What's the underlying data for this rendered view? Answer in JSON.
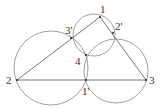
{
  "points": {
    "p1": {
      "label": "1",
      "x": 100,
      "y": 17
    },
    "p2": {
      "label": "2",
      "x": 17,
      "y": 80
    },
    "p3": {
      "label": "3",
      "x": 146,
      "y": 80
    },
    "p1p": {
      "label": "1'",
      "x": 86,
      "y": 80
    },
    "p2p": {
      "label": "2'",
      "x": 113,
      "y": 33
    },
    "p3p": {
      "label": "3'",
      "x": 71,
      "y": 38
    },
    "p4": {
      "label": "4",
      "x": 86,
      "y": 55
    }
  },
  "circles": [
    {
      "name": "small-circle",
      "cx": 94,
      "cy": 35,
      "r": 21
    },
    {
      "name": "left-circle",
      "cx": 51,
      "cy": 68,
      "r": 37
    },
    {
      "name": "right-circle",
      "cx": 116,
      "cy": 71,
      "r": 32
    }
  ],
  "colors": {
    "stroke": "#777777",
    "text": "#333333"
  }
}
